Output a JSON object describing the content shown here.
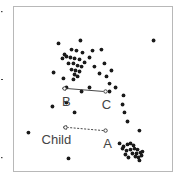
{
  "chart_data": {
    "type": "scatter",
    "title": "",
    "xlabel": "",
    "ylabel": "",
    "xlim": [
      0,
      100
    ],
    "ylim": [
      0,
      100
    ],
    "y_axis_direction": "down",
    "grid": false,
    "legend": "none",
    "colors": {
      "points": "#1a1a1a",
      "frame": "#b8b8b8",
      "labels": "#444444"
    },
    "points": [
      [
        28.3,
        22.4
      ],
      [
        42.1,
        20.6
      ],
      [
        88.1,
        20.6
      ],
      [
        32.1,
        29.1
      ],
      [
        36.5,
        26.1
      ],
      [
        39.6,
        26.7
      ],
      [
        43.4,
        27.9
      ],
      [
        49.7,
        26.7
      ],
      [
        55.3,
        26.1
      ],
      [
        30.8,
        31.5
      ],
      [
        33.3,
        30.3
      ],
      [
        35.8,
        30.9
      ],
      [
        38.4,
        31.5
      ],
      [
        41.5,
        32.1
      ],
      [
        44.7,
        33.9
      ],
      [
        47.8,
        30.9
      ],
      [
        34.6,
        34.5
      ],
      [
        37.7,
        34.5
      ],
      [
        40.3,
        35.8
      ],
      [
        42.8,
        36.4
      ],
      [
        50.9,
        36.4
      ],
      [
        57.2,
        34.5
      ],
      [
        36.5,
        38.2
      ],
      [
        39.0,
        38.8
      ],
      [
        41.5,
        39.4
      ],
      [
        38.4,
        41.2
      ],
      [
        40.3,
        42.4
      ],
      [
        37.7,
        44.2
      ],
      [
        25.2,
        40.0
      ],
      [
        31.4,
        43.6
      ],
      [
        54.1,
        40.6
      ],
      [
        58.5,
        42.4
      ],
      [
        61.6,
        38.8
      ],
      [
        33.3,
        49.1
      ],
      [
        42.8,
        51.5
      ],
      [
        47.8,
        49.1
      ],
      [
        60.4,
        46.7
      ],
      [
        60.4,
        51.5
      ],
      [
        64.2,
        49.1
      ],
      [
        69.2,
        53.9
      ],
      [
        68.6,
        59.4
      ],
      [
        69.8,
        64.2
      ],
      [
        33.3,
        58.2
      ],
      [
        24.5,
        60.6
      ],
      [
        38.4,
        64.2
      ],
      [
        71.7,
        69.7
      ],
      [
        79.2,
        75.2
      ],
      [
        9.4,
        76.4
      ],
      [
        34.6,
        92.1
      ],
      [
        66.7,
        83.0
      ],
      [
        69.2,
        84.8
      ],
      [
        71.7,
        83.6
      ],
      [
        73.6,
        83.0
      ],
      [
        75.5,
        84.2
      ],
      [
        68.6,
        86.1
      ],
      [
        71.1,
        87.3
      ],
      [
        73.6,
        86.7
      ],
      [
        76.1,
        86.1
      ],
      [
        78.0,
        86.7
      ],
      [
        70.4,
        89.7
      ],
      [
        74.8,
        89.1
      ],
      [
        77.4,
        89.1
      ],
      [
        79.9,
        88.5
      ],
      [
        81.1,
        87.9
      ],
      [
        72.3,
        91.5
      ],
      [
        76.7,
        90.9
      ],
      [
        78.6,
        91.5
      ],
      [
        80.5,
        90.3
      ],
      [
        79.2,
        93.3
      ]
    ],
    "annotations": [
      {
        "from_label": "C",
        "to_label": "B",
        "from": [
          57.9,
          51.5
        ],
        "to": [
          32.1,
          49.7
        ],
        "style": "solid"
      },
      {
        "from_label": "A",
        "to_label": "Child",
        "from": [
          57.9,
          75.2
        ],
        "to": [
          32.7,
          73.3
        ],
        "style": "dashed"
      }
    ],
    "labels": [
      {
        "text": "B",
        "at": [
          33.3,
          60.0
        ]
      },
      {
        "text": "C",
        "at": [
          58.5,
          62.4
        ]
      },
      {
        "text": "Child",
        "at": [
          27.0,
          83.6
        ]
      },
      {
        "text": "A",
        "at": [
          59.1,
          85.5
        ]
      }
    ]
  }
}
